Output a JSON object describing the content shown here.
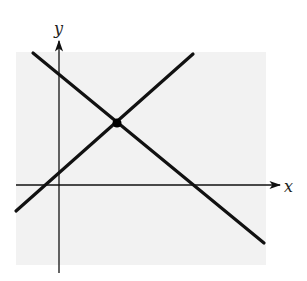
{
  "diagram": {
    "type": "coordinate-plane-two-lines",
    "axes": {
      "x_label": "x",
      "y_label": "y"
    },
    "colors": {
      "background_panel": "#f2f2f2",
      "line": "#111111",
      "axis": "#111111"
    },
    "lines": [
      {
        "name": "decreasing-line",
        "slope_sign": "negative"
      },
      {
        "name": "increasing-line",
        "slope_sign": "positive"
      }
    ],
    "intersection": {
      "marked": true
    }
  }
}
